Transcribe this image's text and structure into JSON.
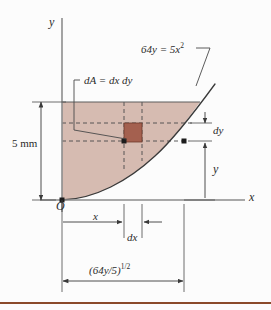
{
  "figure": {
    "kind": "engineering-diagram",
    "axes": {
      "y_axis_label": "y",
      "x_axis_label": "x",
      "origin_label": "O"
    },
    "labels": {
      "curve_equation_lead": "64y = 5x",
      "curve_equation_exponent": "2",
      "differential_area": "dA = dx dy",
      "height_dimension": "5 mm",
      "dy_label": "dy",
      "y_label": "y",
      "x_label": "x",
      "dx_label": "dx",
      "width_dimension_base": "(64y/5)",
      "width_dimension_exponent": "1/2"
    },
    "colors": {
      "shaded_region": "#d6bbb1",
      "shaded_region_edge": "#6b6b6b",
      "element_fill": "#a4604f",
      "element_edge": "#6e3a2c",
      "line": "#3a3a3a",
      "dashed_line": "#4a4a4a",
      "background": "#fcfcfc",
      "bottom_rule": "#8b4a2b"
    },
    "geometry": {
      "origin_px": [
        62,
        200
      ],
      "curve_top_px": [
        200,
        102
      ],
      "region_top_y_px": 102,
      "element_rect_px": [
        124,
        123,
        18,
        19
      ],
      "dashed_y_upper_px": 123,
      "dashed_y_lower_px": 141,
      "dashed_x_left_px": 124,
      "dashed_x_right_px": 142,
      "curve_point_px": [
        184,
        141
      ]
    }
  }
}
